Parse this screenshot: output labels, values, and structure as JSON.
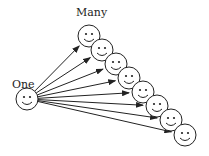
{
  "diagram": {
    "source_label": "One",
    "target_label": "Many",
    "source": {
      "cx": 27,
      "cy": 99,
      "r": 11
    },
    "targets": [
      {
        "cx": 89,
        "cy": 36
      },
      {
        "cx": 102,
        "cy": 50
      },
      {
        "cx": 116,
        "cy": 64
      },
      {
        "cx": 129,
        "cy": 78
      },
      {
        "cx": 143,
        "cy": 92
      },
      {
        "cx": 157,
        "cy": 106
      },
      {
        "cx": 171,
        "cy": 120
      },
      {
        "cx": 185,
        "cy": 135
      }
    ],
    "face_radius": 11,
    "stroke_color": "#222222"
  }
}
